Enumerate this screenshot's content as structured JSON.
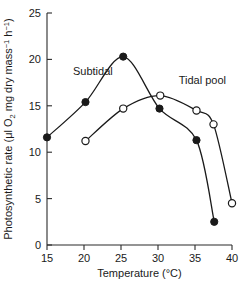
{
  "chart_data": {
    "type": "line",
    "title": "",
    "xlabel": "Temperature (°C)",
    "ylabel": "Photosynthetic rate (μl O2 mg dry mass⁻¹ h⁻¹)",
    "ylabel_parts": {
      "main": "Photosynthetic rate (μl O",
      "sub_2": "2",
      "mid": " mg dry mass",
      "sup_1": "−1",
      "mid2": " h",
      "sup_2": "−1",
      "close": ")"
    },
    "xlim": [
      15,
      40
    ],
    "ylim": [
      0,
      25
    ],
    "xticks": [
      15,
      20,
      25,
      30,
      35,
      40
    ],
    "xtick_labels": [
      "15",
      "20",
      "25",
      "30",
      "35",
      "40"
    ],
    "yticks": [
      0,
      5,
      10,
      15,
      20,
      25
    ],
    "ytick_labels": [
      "0",
      "5",
      "10",
      "15",
      "20",
      "25"
    ],
    "grid": false,
    "legend_position": "inline-annotation",
    "series": [
      {
        "name": "Subtidal",
        "marker": "filled-circle",
        "label_x": 21.2,
        "label_y": 18.3,
        "points": [
          {
            "x": 15.0,
            "y": 11.6
          },
          {
            "x": 20.2,
            "y": 15.4
          },
          {
            "x": 25.3,
            "y": 20.3
          },
          {
            "x": 30.2,
            "y": 14.7
          },
          {
            "x": 35.2,
            "y": 11.3
          },
          {
            "x": 37.6,
            "y": 2.5
          }
        ]
      },
      {
        "name": "Tidal pool",
        "marker": "open-circle",
        "label_x": 36.0,
        "label_y": 17.4,
        "points": [
          {
            "x": 20.2,
            "y": 11.2
          },
          {
            "x": 25.3,
            "y": 14.7
          },
          {
            "x": 30.3,
            "y": 16.1
          },
          {
            "x": 35.2,
            "y": 14.5
          },
          {
            "x": 37.5,
            "y": 13.0
          },
          {
            "x": 40.0,
            "y": 4.5
          }
        ]
      }
    ]
  },
  "colors": {
    "ink": "#1a1a1a",
    "background": "#ffffff"
  }
}
